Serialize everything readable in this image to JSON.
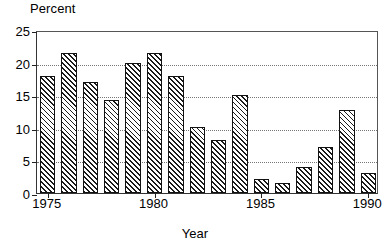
{
  "chart_data": {
    "type": "bar",
    "title": "",
    "ylabel": "Percent",
    "xlabel": "Year",
    "categories": [
      "1975",
      "1976",
      "1977",
      "1978",
      "1979",
      "1980",
      "1981",
      "1982",
      "1983",
      "1984",
      "1985",
      "1986",
      "1987",
      "1988",
      "1989",
      "1990"
    ],
    "values": [
      18.0,
      21.5,
      17.0,
      14.3,
      20.0,
      21.5,
      18.0,
      10.2,
      8.2,
      15.0,
      2.2,
      1.6,
      4.0,
      7.0,
      12.7,
      3.0
    ],
    "ylim": [
      0,
      25
    ],
    "yticks": [
      0,
      5,
      10,
      15,
      20,
      25
    ],
    "ytick_labels": [
      "0",
      "5",
      "10",
      "15",
      "20",
      "25"
    ],
    "xtick_years": [
      1975,
      1980,
      1985,
      1990
    ],
    "xtick_labels": [
      "1975",
      "1980",
      "1985",
      "1990"
    ],
    "xlim": [
      1974.5,
      1990.5
    ],
    "grid": true,
    "grid_style": "dotted-horizontal",
    "legend": "none",
    "bar_fill": "diagonal-hatch",
    "bar_edge_color": "#111111",
    "bar_face_color": "#ffffff",
    "hatch_color": "#1a1a1a",
    "axis_color": "#222222",
    "grid_color": "#777777",
    "background": "#ffffff"
  }
}
